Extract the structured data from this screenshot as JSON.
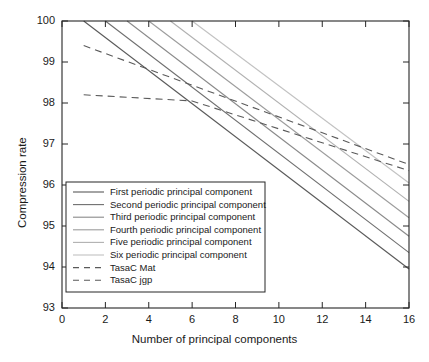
{
  "chart_data": {
    "type": "line",
    "title": "",
    "xlabel": "Number of principal components",
    "ylabel": "Compression rate",
    "xlim": [
      0,
      16
    ],
    "ylim": [
      93,
      100
    ],
    "xticks": [
      0,
      2,
      4,
      6,
      8,
      10,
      12,
      14,
      16
    ],
    "yticks": [
      93,
      94,
      95,
      96,
      97,
      98,
      99,
      100
    ],
    "grid": false,
    "legend_position": "lower left",
    "series": [
      {
        "name": "First periodic principal component",
        "style": "solid",
        "color": "#5a5a5a",
        "x": [
          1,
          16
        ],
        "y": [
          100,
          93.95
        ]
      },
      {
        "name": "Second periodic principal component",
        "style": "solid",
        "color": "#6e6e6e",
        "x": [
          2,
          16
        ],
        "y": [
          100,
          94.35
        ]
      },
      {
        "name": "Third periodic principal component",
        "style": "solid",
        "color": "#8a8a8a",
        "x": [
          3,
          16
        ],
        "y": [
          100,
          94.75
        ]
      },
      {
        "name": "Fourth periodic principal component",
        "style": "solid",
        "color": "#9c9c9c",
        "x": [
          4,
          16
        ],
        "y": [
          100,
          95.2
        ]
      },
      {
        "name": "Five  periodic principal component",
        "style": "solid",
        "color": "#b0b0b0",
        "x": [
          5,
          16
        ],
        "y": [
          100,
          95.6
        ]
      },
      {
        "name": "Six  periodic principal component",
        "style": "solid",
        "color": "#c2c2c2",
        "x": [
          6,
          16
        ],
        "y": [
          100,
          96.05
        ]
      },
      {
        "name": "TasaC Mat",
        "style": "dashed",
        "color": "#5a5a5a",
        "x": [
          1,
          16
        ],
        "y": [
          99.4,
          96.5
        ]
      },
      {
        "name": "TasaC jgp",
        "style": "dashed",
        "color": "#5a5a5a",
        "x": [
          1,
          6,
          16
        ],
        "y": [
          98.2,
          98.05,
          96.35
        ]
      }
    ]
  }
}
